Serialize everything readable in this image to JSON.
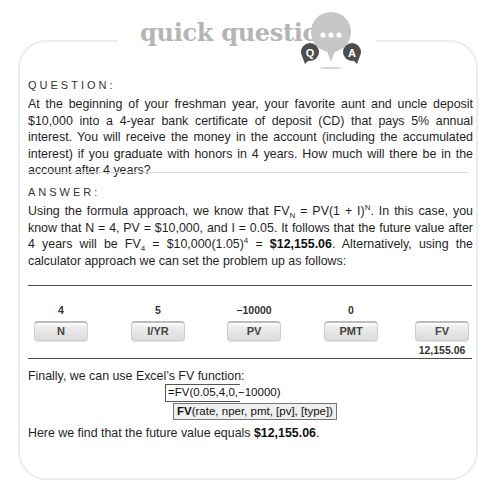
{
  "header": {
    "title": "quick question",
    "icon": "qa-speech-bubbles-icon",
    "icon_q_label": "Q",
    "icon_a_label": "A",
    "icon_dots": "•••"
  },
  "question": {
    "label": "QUESTION:",
    "text": "At the beginning of your freshman year, your favorite aunt and uncle deposit $10,000 into a 4-year bank certificate of deposit (CD) that pays 5% annual interest. You will receive the money in the account (including the accumulated interest) if you graduate with honors in 4 years. How much will there be in the account after 4 years?"
  },
  "answer": {
    "label": "ANSWER:",
    "p1_part1": "Using the formula approach, we know that FV",
    "p1_sub_N": "N",
    "p1_part2": " = PV(1 + I)",
    "p1_sup_N": "N",
    "p1_part3": ". In this case, you know that N = 4, PV = $10,000, and I = 0.05. It follows that the future value after 4 years will be FV",
    "p1_sub_4": "4",
    "p1_part4": " = $10,000(1.05)",
    "p1_sup_4": "4",
    "p1_part5": " = ",
    "p1_bold_result": "$12,155.06",
    "p1_part6": ". Alternatively, using the calculator approach we can set the problem up as follows:",
    "calculator": {
      "inputs": [
        {
          "value": "4",
          "key": "N"
        },
        {
          "value": "5",
          "key": "I/YR"
        },
        {
          "value": "−10000",
          "key": "PV"
        },
        {
          "value": "0",
          "key": "PMT"
        },
        {
          "value": "",
          "key": "FV"
        }
      ],
      "result": "12,155.06"
    },
    "excel_intro": "Finally, we can use Excel’s FV function:",
    "excel_formula": "=FV(0.05,4,0,−10000)",
    "excel_tooltip_fn": "FV",
    "excel_tooltip_args": "(rate, nper, pmt, [pv], [type])",
    "conclusion_text": "Here we find that the future value equals ",
    "conclusion_bold": "$12,155.06",
    "conclusion_end": "."
  },
  "colors": {
    "title_gray": "#b5b5b5",
    "icon_bubble": "#c4c4c4",
    "icon_dark": "#4d4d4d",
    "border": "#ededed",
    "rule_dark": "#4a4a4a"
  }
}
